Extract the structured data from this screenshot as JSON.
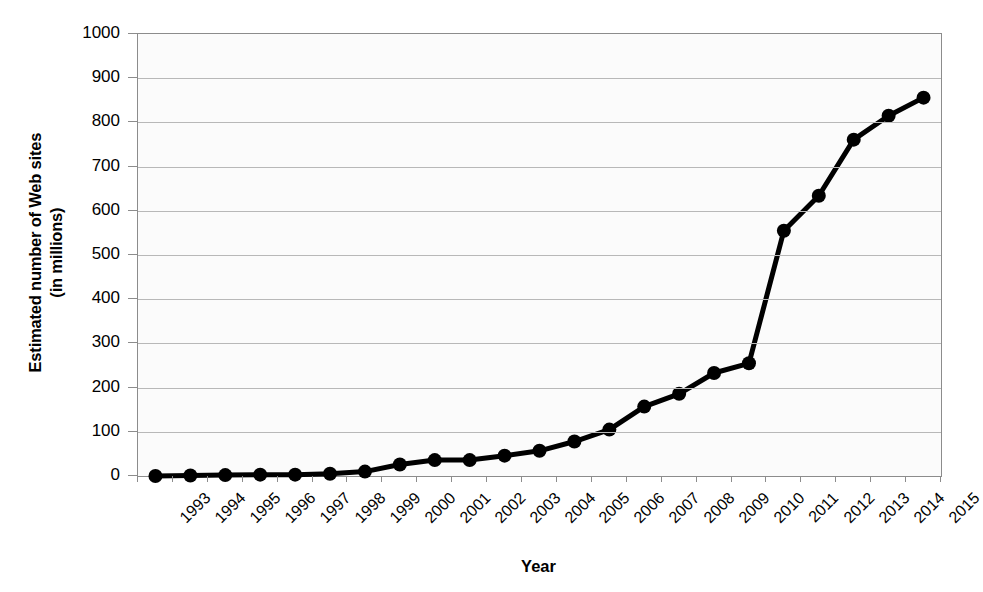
{
  "chart_data": {
    "type": "line",
    "title": "",
    "xlabel": "Year",
    "ylabel": "Estimated number of Web sites\n(in millions)",
    "ylabel_line1": "Estimated number of Web sites",
    "ylabel_line2": "(in millions)",
    "categories": [
      "1993",
      "1994",
      "1995",
      "1996",
      "1997",
      "1998",
      "1999",
      "2000",
      "2001",
      "2002",
      "2003",
      "2004",
      "2005",
      "2006",
      "2007",
      "2008",
      "2009",
      "2010",
      "2011",
      "2012",
      "2013",
      "2014",
      "2015"
    ],
    "values": [
      0,
      1,
      2,
      3,
      3,
      5,
      10,
      26,
      36,
      36,
      46,
      57,
      78,
      105,
      157,
      186,
      233,
      255,
      555,
      634,
      761,
      815,
      856
    ],
    "x": [
      1993,
      1994,
      1995,
      1996,
      1997,
      1998,
      1999,
      2000,
      2001,
      2002,
      2003,
      2004,
      2005,
      2006,
      2007,
      2008,
      2009,
      2010,
      2011,
      2012,
      2013,
      2014,
      2015
    ],
    "ylim": [
      0,
      1000
    ],
    "y_ticks": [
      0,
      100,
      200,
      300,
      400,
      500,
      600,
      700,
      800,
      900,
      1000
    ],
    "y_ticklabels": [
      "0",
      "100",
      "200",
      "300",
      "400",
      "500",
      "600",
      "700",
      "800",
      "900",
      "1000"
    ],
    "grid": "horizontal",
    "legend": "none",
    "marker": "filled-circle",
    "series_color": "#000000",
    "grid_color": "#b8b8b8",
    "plot_background": "#fbfbfb",
    "axis_color": "#8c8c8c"
  },
  "axis": {
    "x_title": "Year",
    "y_title_line1": "Estimated number of Web sites",
    "y_title_line2": "(in millions)"
  }
}
